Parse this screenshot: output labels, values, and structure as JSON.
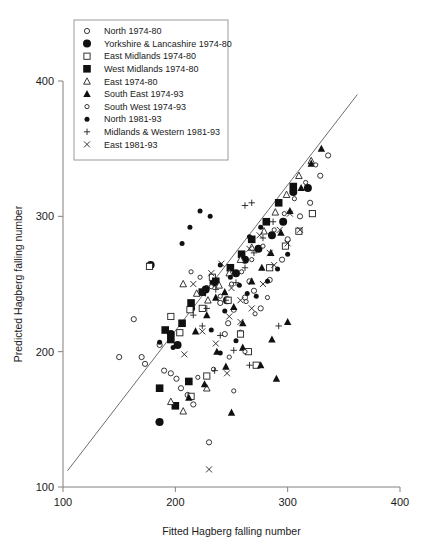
{
  "chart_data": {
    "type": "scatter",
    "title": "",
    "xlabel": "Fitted Hagberg falling number",
    "ylabel": "Predicted Hagberg falling number",
    "xlim": [
      100,
      400
    ],
    "ylim": [
      100,
      400
    ],
    "xticks": [
      100,
      200,
      300,
      400
    ],
    "yticks": [
      100,
      200,
      300,
      400
    ],
    "grid": false,
    "legend_position": "top-left inside",
    "reference_line": {
      "kind": "identity-fit-line",
      "x0": 104,
      "y0": 112,
      "x1": 362,
      "y1": 390
    },
    "series": [
      {
        "name": "North 1974-80",
        "marker": "open-circle-small",
        "points": [
          [
            150,
            196
          ],
          [
            163,
            224
          ],
          [
            170,
            196
          ],
          [
            173,
            191
          ],
          [
            186,
            205
          ],
          [
            190,
            186
          ],
          [
            196,
            184
          ],
          [
            201,
            180
          ],
          [
            205,
            173
          ],
          [
            211,
            168
          ],
          [
            216,
            161
          ],
          [
            185,
            148
          ],
          [
            230,
            133
          ],
          [
            244,
            213
          ],
          [
            252,
            231
          ],
          [
            262,
            240
          ],
          [
            266,
            252
          ],
          [
            276,
            232
          ],
          [
            284,
            253
          ],
          [
            295,
            268
          ],
          [
            300,
            283
          ],
          [
            311,
            300
          ],
          [
            320,
            310
          ],
          [
            329,
            330
          ],
          [
            336,
            345
          ],
          [
            228,
            247
          ],
          [
            240,
            236
          ],
          [
            247,
            221
          ],
          [
            258,
            214
          ],
          [
            270,
            245
          ]
        ]
      },
      {
        "name": "Yorkshire & Lancashire 1974-80",
        "marker": "filled-circle-large",
        "points": [
          [
            178,
            264
          ],
          [
            196,
            213
          ],
          [
            202,
            205
          ],
          [
            214,
            232
          ],
          [
            227,
            246
          ],
          [
            234,
            251
          ],
          [
            246,
            238
          ],
          [
            254,
            258
          ],
          [
            262,
            268
          ],
          [
            274,
            276
          ],
          [
            286,
            286
          ],
          [
            296,
            296
          ],
          [
            305,
            318
          ],
          [
            318,
            321
          ],
          [
            186,
            148
          ]
        ]
      },
      {
        "name": "East Midlands 1974-80",
        "marker": "open-square",
        "points": [
          [
            177,
            263
          ],
          [
            196,
            226
          ],
          [
            204,
            214
          ],
          [
            213,
            231
          ],
          [
            224,
            232
          ],
          [
            233,
            255
          ],
          [
            247,
            238
          ],
          [
            258,
            213
          ],
          [
            265,
            200
          ],
          [
            272,
            190
          ],
          [
            284,
            262
          ],
          [
            298,
            278
          ],
          [
            310,
            289
          ],
          [
            322,
            302
          ],
          [
            214,
            167
          ],
          [
            228,
            182
          ]
        ]
      },
      {
        "name": "West Midlands 1974-80",
        "marker": "filled-square",
        "points": [
          [
            191,
            216
          ],
          [
            196,
            209
          ],
          [
            206,
            221
          ],
          [
            214,
            236
          ],
          [
            224,
            244
          ],
          [
            236,
            252
          ],
          [
            249,
            262
          ],
          [
            259,
            272
          ],
          [
            268,
            283
          ],
          [
            281,
            296
          ],
          [
            292,
            310
          ],
          [
            305,
            322
          ],
          [
            186,
            173
          ],
          [
            200,
            160
          ],
          [
            212,
            178
          ]
        ]
      },
      {
        "name": "East 1974-80",
        "marker": "open-triangle",
        "points": [
          [
            207,
            250
          ],
          [
            219,
            243
          ],
          [
            229,
            238
          ],
          [
            239,
            249
          ],
          [
            248,
            258
          ],
          [
            258,
            268
          ],
          [
            268,
            277
          ],
          [
            279,
            289
          ],
          [
            289,
            303
          ],
          [
            299,
            316
          ],
          [
            310,
            330
          ],
          [
            321,
            341
          ],
          [
            196,
            163
          ],
          [
            207,
            156
          ],
          [
            228,
            173
          ]
        ]
      },
      {
        "name": "South East 1974-93",
        "marker": "filled-triangle",
        "points": [
          [
            218,
            215
          ],
          [
            228,
            227
          ],
          [
            236,
            240
          ],
          [
            244,
            244
          ],
          [
            252,
            233
          ],
          [
            260,
            221
          ],
          [
            268,
            252
          ],
          [
            277,
            262
          ],
          [
            285,
            273
          ],
          [
            294,
            288
          ],
          [
            302,
            304
          ],
          [
            312,
            321
          ],
          [
            321,
            339
          ],
          [
            330,
            350
          ],
          [
            212,
            166
          ],
          [
            226,
            176
          ],
          [
            245,
            189
          ],
          [
            260,
            203
          ],
          [
            276,
            190
          ],
          [
            290,
            180
          ],
          [
            286,
            209
          ],
          [
            300,
            222
          ],
          [
            250,
            155
          ],
          [
            237,
            200
          ]
        ]
      },
      {
        "name": "South West 1974-93",
        "marker": "open-circle-tiny",
        "points": [
          [
            214,
            259
          ],
          [
            222,
            255
          ],
          [
            232,
            248
          ],
          [
            240,
            241
          ],
          [
            250,
            250
          ],
          [
            259,
            259
          ],
          [
            268,
            268
          ],
          [
            278,
            278
          ],
          [
            288,
            290
          ],
          [
            297,
            302
          ],
          [
            306,
            313
          ],
          [
            316,
            325
          ],
          [
            325,
            338
          ],
          [
            220,
            181
          ],
          [
            234,
            187
          ],
          [
            248,
            196
          ],
          [
            262,
            200
          ],
          [
            252,
            171
          ],
          [
            271,
            228
          ],
          [
            282,
            240
          ],
          [
            263,
            237
          ]
        ]
      },
      {
        "name": "North 1981-93",
        "marker": "filled-circle-small",
        "points": [
          [
            206,
            280
          ],
          [
            213,
            292
          ],
          [
            222,
            304
          ],
          [
            231,
            300
          ],
          [
            240,
            264
          ],
          [
            249,
            255
          ],
          [
            257,
            249
          ],
          [
            264,
            243
          ],
          [
            272,
            241
          ],
          [
            282,
            252
          ],
          [
            291,
            261
          ],
          [
            300,
            272
          ],
          [
            240,
            199
          ],
          [
            254,
            208
          ],
          [
            186,
            207
          ],
          [
            198,
            203
          ],
          [
            232,
            216
          ],
          [
            244,
            230
          ],
          [
            266,
            285
          ],
          [
            276,
            292
          ]
        ]
      },
      {
        "name": "Midlands & Western 1981-93",
        "marker": "plus",
        "points": [
          [
            228,
            232
          ],
          [
            236,
            246
          ],
          [
            245,
            238
          ],
          [
            254,
            251
          ],
          [
            262,
            262
          ],
          [
            270,
            273
          ],
          [
            278,
            284
          ],
          [
            287,
            296
          ],
          [
            262,
            308
          ],
          [
            268,
            310
          ],
          [
            216,
            227
          ],
          [
            224,
            219
          ],
          [
            240,
            212
          ],
          [
            252,
            201
          ],
          [
            235,
            186
          ],
          [
            266,
            190
          ],
          [
            292,
            219
          ]
        ]
      },
      {
        "name": "East 1981-93",
        "marker": "cross",
        "points": [
          [
            216,
            250
          ],
          [
            224,
            243
          ],
          [
            232,
            258
          ],
          [
            241,
            265
          ],
          [
            250,
            247
          ],
          [
            258,
            238
          ],
          [
            266,
            276
          ],
          [
            275,
            286
          ],
          [
            284,
            273
          ],
          [
            293,
            290
          ],
          [
            302,
            302
          ],
          [
            311,
            290
          ],
          [
            224,
            215
          ],
          [
            236,
            206
          ],
          [
            248,
            226
          ],
          [
            258,
            222
          ],
          [
            246,
            184
          ],
          [
            268,
            232
          ],
          [
            278,
            250
          ],
          [
            230,
            113
          ],
          [
            288,
            264
          ],
          [
            300,
            280
          ],
          [
            208,
            198
          ]
        ]
      }
    ]
  },
  "legend": {
    "entries": [
      {
        "label": "North 1974-80",
        "marker": "open-circle-small"
      },
      {
        "label": "Yorkshire & Lancashire 1974-80",
        "marker": "filled-circle-large"
      },
      {
        "label": "East Midlands 1974-80",
        "marker": "open-square"
      },
      {
        "label": "West Midlands 1974-80",
        "marker": "filled-square"
      },
      {
        "label": "East 1974-80",
        "marker": "open-triangle"
      },
      {
        "label": "South East 1974-93",
        "marker": "filled-triangle"
      },
      {
        "label": "South West 1974-93",
        "marker": "open-circle-tiny"
      },
      {
        "label": "North 1981-93",
        "marker": "filled-circle-small"
      },
      {
        "label": "Midlands & Western 1981-93",
        "marker": "plus"
      },
      {
        "label": "East 1981-93",
        "marker": "cross"
      }
    ]
  },
  "colors": {
    "ink": "#101010",
    "axis": "#808080",
    "line": "#6e6e6e",
    "background": "#ffffff"
  }
}
